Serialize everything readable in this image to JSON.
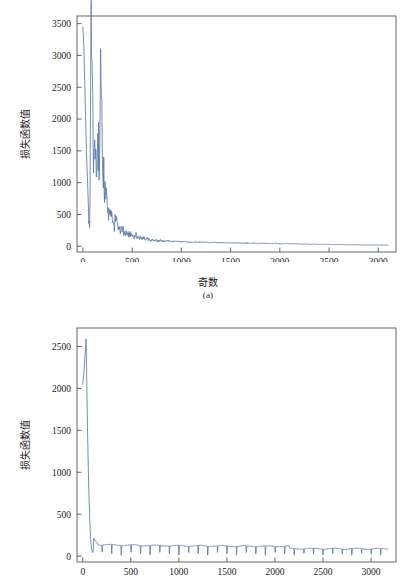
{
  "figure": {
    "background": "#ffffff",
    "line_color": "#5b7aa8",
    "axis_color": "#555555"
  },
  "chart_data": [
    {
      "id": "a",
      "type": "line",
      "title": "",
      "caption": "(a)",
      "xlabel": "奇数",
      "ylabel": "损失函数值",
      "xlim": [
        -60,
        3180
      ],
      "ylim": [
        -90,
        3620
      ],
      "xticks": [
        0,
        500,
        1000,
        1500,
        2000,
        2500,
        3000
      ],
      "xticklabels": [
        "0",
        "500",
        "1000",
        "1500",
        "2000",
        "2500",
        "3000"
      ],
      "yticks": [
        0,
        500,
        1000,
        1500,
        2000,
        2500,
        3000,
        3500
      ],
      "yticklabels": [
        "0",
        "500",
        "1000",
        "1500",
        "2000",
        "2500",
        "3000",
        "3500"
      ],
      "grid": false,
      "legend": null,
      "series": [
        {
          "name": "loss",
          "color": "#5b7aa8",
          "description": "Training loss decaying from ~3450 with large noisy oscillations, settling near 20 after epoch ~2100",
          "x": [
            0,
            10,
            20,
            30,
            40,
            50,
            60,
            70,
            80,
            90,
            100,
            110,
            120,
            130,
            140,
            150,
            160,
            170,
            180,
            190,
            200,
            210,
            220,
            230,
            240,
            250,
            260,
            270,
            280,
            290,
            300,
            320,
            340,
            360,
            380,
            400,
            420,
            440,
            460,
            480,
            500,
            520,
            540,
            560,
            580,
            600,
            620,
            640,
            660,
            680,
            700,
            740,
            780,
            820,
            860,
            900,
            950,
            1000,
            1050,
            1100,
            1150,
            1200,
            1250,
            1300,
            1350,
            1400,
            1450,
            1500,
            1550,
            1600,
            1650,
            1700,
            1750,
            1800,
            1850,
            1900,
            1950,
            2000,
            2050,
            2100,
            2200,
            2400,
            2600,
            2800,
            3000,
            3100
          ],
          "y": [
            3450,
            3120,
            2500,
            1850,
            1300,
            900,
            430,
            180,
            3380,
            2700,
            1950,
            1450,
            1620,
            1550,
            1480,
            1600,
            1520,
            1400,
            2720,
            1950,
            1500,
            1150,
            980,
            860,
            700,
            620,
            560,
            480,
            430,
            600,
            380,
            310,
            560,
            330,
            260,
            300,
            200,
            230,
            175,
            195,
            160,
            150,
            175,
            130,
            145,
            120,
            130,
            105,
            115,
            95,
            100,
            88,
            95,
            80,
            86,
            75,
            78,
            70,
            72,
            65,
            68,
            62,
            64,
            58,
            60,
            55,
            57,
            52,
            54,
            50,
            51,
            48,
            49,
            46,
            47,
            44,
            45,
            42,
            43,
            40,
            36,
            30,
            26,
            22,
            20,
            18
          ]
        }
      ]
    },
    {
      "id": "b",
      "type": "line",
      "title": "",
      "caption": "",
      "xlabel": "",
      "ylabel": "损失函数值",
      "xlim": [
        -60,
        3260
      ],
      "ylim": [
        -70,
        2720
      ],
      "xticks": [
        0,
        500,
        1000,
        1500,
        2000,
        2500,
        3000
      ],
      "xticklabels": [
        "0",
        "500",
        "1000",
        "1500",
        "2000",
        "2500",
        "3000"
      ],
      "yticks": [
        0,
        500,
        1000,
        1500,
        2000,
        2500
      ],
      "yticklabels": [
        "0",
        "500",
        "1000",
        "1500",
        "2000",
        "2500"
      ],
      "grid": false,
      "legend": null,
      "series": [
        {
          "name": "loss",
          "color": "#5b7aa8",
          "description": "Loss spikes to ~2590 near epoch 35, collapses to ~150 by epoch 150, then a periodic comb of downward spikes to ~10 repeating about every 100 epochs on a plateau near 100-130",
          "spike_peak": 2590,
          "spike_epoch": 35,
          "plateau_level": 115,
          "spike_period": 100,
          "spike_min": 12
        }
      ]
    }
  ]
}
